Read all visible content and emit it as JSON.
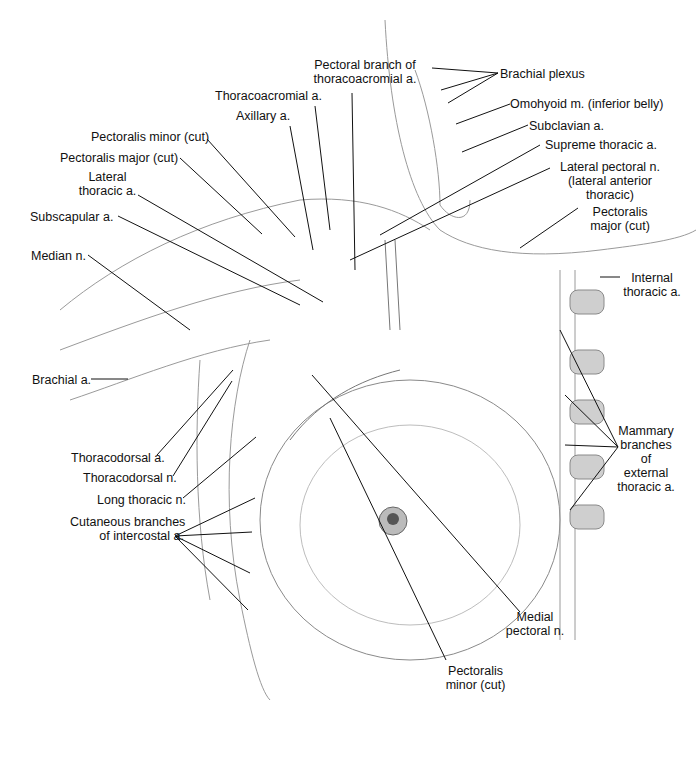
{
  "figure": {
    "labels": {
      "brachial_plexus": "Brachial plexus",
      "omohyoid": "Omohyoid m. (inferior belly)",
      "subclavian": "Subclavian a.",
      "supreme_thoracic": "Supreme thoracic a.",
      "lateral_pectoral_1": "Lateral pectoral n.",
      "lateral_pectoral_2": "(lateral anterior",
      "lateral_pectoral_3": "thoracic)",
      "pect_major_right_1": "Pectoralis",
      "pect_major_right_2": "major (cut)",
      "internal_thoracic_1": "Internal",
      "internal_thoracic_2": "thoracic a.",
      "mammary_1": "Mammary",
      "mammary_2": "branches",
      "mammary_3": "of",
      "mammary_4": "external",
      "mammary_5": "thoracic a.",
      "pectoral_branch_1": "Pectoral branch of",
      "pectoral_branch_2": "thoracoacromial a.",
      "thoracoacromial": "Thoracoacromial a.",
      "axillary": "Axillary a.",
      "pect_minor_cut": "Pectoralis minor (cut)",
      "pect_major_cut": "Pectoralis major (cut)",
      "lateral_thoracic_1": "Lateral",
      "lateral_thoracic_2": "thoracic a.",
      "subscapular": "Subscapular a.",
      "median": "Median n.",
      "brachial_a": "Brachial a.",
      "thoracodorsal_a": "Thoracodorsal a.",
      "thoracodorsal_n": "Thoracodorsal n.",
      "long_thoracic": "Long thoracic n.",
      "cutaneous_1": "Cutaneous branches",
      "cutaneous_2": "of intercostal a.",
      "medial_pectoral_1": "Medial",
      "medial_pectoral_2": "pectoral n.",
      "pect_minor_bottom_1": "Pectoralis",
      "pect_minor_bottom_2": "minor (cut)"
    }
  }
}
